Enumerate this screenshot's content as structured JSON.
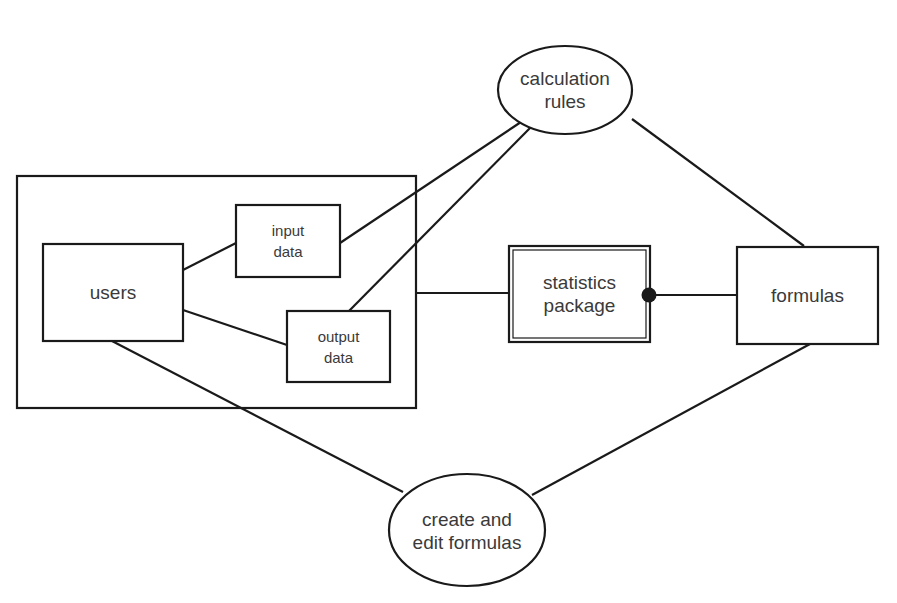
{
  "diagram": {
    "type": "entity-relationship",
    "nodes": {
      "calculation_rules": {
        "shape": "ellipse",
        "lines": [
          "calculation",
          "rules"
        ]
      },
      "users": {
        "shape": "rectangle",
        "lines": [
          "users"
        ]
      },
      "input_data": {
        "shape": "rectangle",
        "lines": [
          "input",
          "data"
        ]
      },
      "output_data": {
        "shape": "rectangle",
        "lines": [
          "output",
          "data"
        ]
      },
      "statistics_package": {
        "shape": "double-rectangle",
        "lines": [
          "statistics",
          "package"
        ]
      },
      "formulas": {
        "shape": "rectangle",
        "lines": [
          "formulas"
        ]
      },
      "create_edit_formulas": {
        "shape": "ellipse",
        "lines": [
          "create and",
          "edit formulas"
        ]
      },
      "user_group": {
        "shape": "rectangle-container",
        "contains": [
          "users",
          "input_data",
          "output_data"
        ]
      }
    },
    "edges": [
      {
        "from": "users",
        "to": "input_data"
      },
      {
        "from": "users",
        "to": "output_data"
      },
      {
        "from": "input_data",
        "to": "calculation_rules"
      },
      {
        "from": "output_data",
        "to": "calculation_rules"
      },
      {
        "from": "calculation_rules",
        "to": "formulas"
      },
      {
        "from": "user_group",
        "to": "statistics_package"
      },
      {
        "from": "statistics_package",
        "to": "formulas",
        "marker": "filled-dot-at-statistics-package"
      },
      {
        "from": "users",
        "to": "create_edit_formulas"
      },
      {
        "from": "formulas",
        "to": "create_edit_formulas"
      }
    ],
    "colors": {
      "stroke": "#1a1a1a",
      "text": "#3a3a3a",
      "background": "#ffffff"
    }
  }
}
